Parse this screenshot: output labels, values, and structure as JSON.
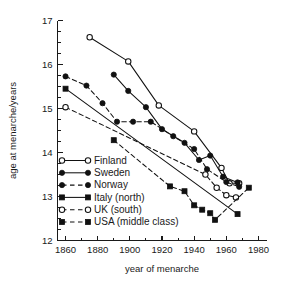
{
  "chart_data": {
    "type": "line",
    "title": "",
    "xlabel": "year of menarche",
    "ylabel": "age at menarche/years",
    "xlim": [
      1855,
      1985
    ],
    "ylim": [
      12,
      17
    ],
    "xticks": [
      1860,
      1880,
      1900,
      1920,
      1940,
      1960,
      1980
    ],
    "yticks": [
      12,
      13,
      14,
      15,
      16,
      17
    ],
    "xtick_labels": [
      "1860",
      "1880",
      "1900",
      "1920",
      "1940",
      "1960",
      "1980"
    ],
    "ytick_labels": [
      "12",
      "13",
      "14",
      "15",
      "16",
      "17"
    ],
    "x_minor_step": 10,
    "y_minor_step": 0.25,
    "grid": false,
    "legend_position": "center-left",
    "series": [
      {
        "name": "Finland",
        "marker": "open-circle",
        "linestyle": "solid",
        "color": "#111111",
        "x": [
          1875,
          1899,
          1918,
          1940,
          1957,
          1962,
          1968
        ],
        "y": [
          16.62,
          16.07,
          15.07,
          14.48,
          13.65,
          13.3,
          13.3
        ]
      },
      {
        "name": "Sweden",
        "marker": "filled-circle",
        "linestyle": "solid",
        "color": "#111111",
        "x": [
          1890,
          1899,
          1910,
          1920,
          1934,
          1943,
          1950,
          1958,
          1967
        ],
        "y": [
          15.77,
          15.4,
          15.03,
          14.53,
          14.22,
          13.83,
          13.93,
          13.45,
          13.32
        ]
      },
      {
        "name": "Norway",
        "marker": "filled-circle",
        "linestyle": "dashed",
        "color": "#111111",
        "x": [
          1860,
          1873,
          1883,
          1892,
          1902,
          1913,
          1927,
          1940,
          1948,
          1960,
          1968
        ],
        "y": [
          15.73,
          15.52,
          15.12,
          14.7,
          14.7,
          14.7,
          14.37,
          14.08,
          13.62,
          13.33,
          13.22
        ]
      },
      {
        "name": "Italy (north)",
        "marker": "filled-square",
        "linestyle": "solid",
        "color": "#111111",
        "x": [
          1860,
          1967
        ],
        "y": [
          15.45,
          12.6
        ]
      },
      {
        "name": "UK (south)",
        "marker": "open-circle",
        "linestyle": "dashed",
        "color": "#111111",
        "x": [
          1860,
          1947,
          1954,
          1960,
          1966
        ],
        "y": [
          15.03,
          13.5,
          13.2,
          13.03,
          12.98
        ]
      },
      {
        "name": "USA (middle class)",
        "marker": "filled-square",
        "linestyle": "dashed",
        "color": "#111111",
        "x": [
          1890,
          1925,
          1934,
          1940,
          1945,
          1950,
          1953,
          1974
        ],
        "y": [
          14.28,
          13.23,
          13.12,
          12.8,
          12.7,
          12.62,
          12.47,
          13.2
        ]
      }
    ]
  },
  "legend": {
    "items": [
      {
        "label": "Finland",
        "marker": "open-circle",
        "linestyle": "solid"
      },
      {
        "label": "Sweden",
        "marker": "filled-circle",
        "linestyle": "solid"
      },
      {
        "label": "Norway",
        "marker": "filled-circle",
        "linestyle": "dashed"
      },
      {
        "label": "Italy (north)",
        "marker": "filled-square",
        "linestyle": "solid"
      },
      {
        "label": "UK (south)",
        "marker": "open-circle",
        "linestyle": "dashed"
      },
      {
        "label": "USA (middle class)",
        "marker": "filled-square",
        "linestyle": "dashed"
      }
    ]
  }
}
